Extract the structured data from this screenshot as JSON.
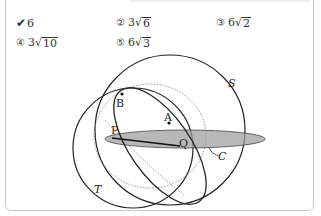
{
  "answer_choices": [
    {
      "id": 1,
      "marker": "✔",
      "selected": true,
      "coef": "6",
      "radicand": ""
    },
    {
      "id": 2,
      "marker": "②",
      "selected": false,
      "coef": "3",
      "radicand": "6"
    },
    {
      "id": 3,
      "marker": "③",
      "selected": false,
      "coef": "6",
      "radicand": "2"
    },
    {
      "id": 4,
      "marker": "④",
      "selected": false,
      "coef": "3",
      "radicand": "10"
    },
    {
      "id": 5,
      "marker": "⑤",
      "selected": false,
      "coef": "6",
      "radicand": "3"
    }
  ],
  "figure": {
    "labels": {
      "S": "S",
      "T": "T",
      "A": "A",
      "B": "B",
      "P": "P",
      "Q": "Q",
      "C": "C"
    }
  }
}
